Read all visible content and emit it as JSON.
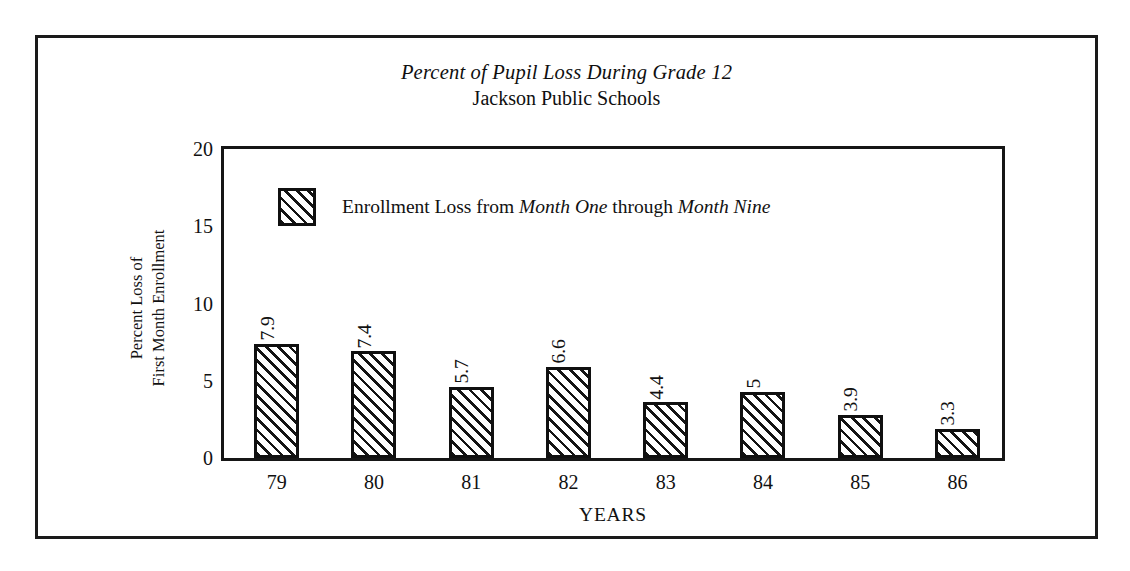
{
  "figure": {
    "title": "Percent of Pupil Loss During Grade 12",
    "subtitle": "Jackson Public Schools"
  },
  "legend": {
    "text_part1": "Enrollment Loss from ",
    "text_italic1": "Month One",
    "text_part2": " through ",
    "text_italic2": "Month Nine",
    "swatch": "hatched-square-icon"
  },
  "axes": {
    "y_title_line1": "Percent Loss of",
    "y_title_line2": "First Month Enrollment",
    "x_title": "YEARS"
  },
  "chart_data": {
    "type": "bar",
    "title": "Percent of Pupil Loss During Grade 12",
    "subtitle": "Jackson Public Schools",
    "xlabel": "YEARS",
    "ylabel": "Percent Loss of First Month Enrollment",
    "ylim": [
      0,
      20
    ],
    "yticks": [
      0,
      5,
      10,
      15,
      20
    ],
    "ytick_labels": [
      "0",
      "5",
      "10",
      "15",
      "20"
    ],
    "grid": false,
    "legend_position": "inside-upper-left",
    "categories": [
      "79",
      "80",
      "81",
      "82",
      "83",
      "84",
      "85",
      "86"
    ],
    "series": [
      {
        "name": "Enrollment Loss from Month One through Month Nine",
        "values": [
          7.9,
          7.4,
          5.7,
          6.6,
          4.4,
          5,
          3.9,
          3.3
        ],
        "data_labels": [
          "7.9",
          "7.4",
          "5.7",
          "6.6",
          "4.4",
          "5",
          "3.9",
          "3.3"
        ],
        "drawn_heights": [
          7.4,
          6.9,
          4.6,
          5.9,
          3.6,
          4.3,
          2.8,
          1.9
        ],
        "fill": "diagonal-hatch",
        "edge_color": "#101010"
      }
    ]
  }
}
